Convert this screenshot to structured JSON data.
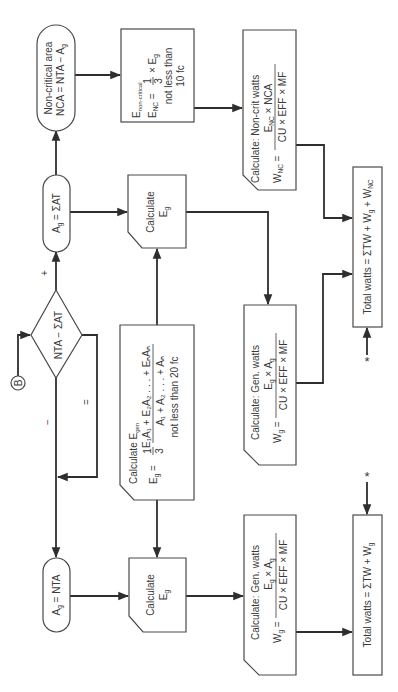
{
  "diagram": {
    "orientation": "rotated-90-ccw",
    "connector": {
      "label": "B"
    },
    "decision": {
      "label": "NTA − ΣAT",
      "branches": {
        "plus": "+",
        "minus": "−",
        "equal": "="
      }
    },
    "terminals": {
      "noncritical": {
        "line1": "Non-critical area",
        "line2_main": "NCA = NTA − A",
        "line2_sub": "g"
      },
      "ag_sum": {
        "main": "A",
        "sub": "g",
        "rest": " = ΣAT"
      },
      "ag_nta": {
        "main": "A",
        "sub": "g",
        "rest": " = NTA"
      }
    },
    "enc_box": {
      "title_main": "E",
      "title_sub": "non-critical",
      "lhs_main": "E",
      "lhs_sub": "NC",
      "eq": " =",
      "num": "1",
      "den": "3",
      "rhs": "× E",
      "rhs_sub": "g",
      "line3": "not less than",
      "line4": "10 fc"
    },
    "calc_eg": {
      "line1": "Calculate",
      "line2_main": "E",
      "line2_sub": "g"
    },
    "egen_box": {
      "title": "Calculate E",
      "title_sub": "gen",
      "lhs_main": "E",
      "lhs_sub": "g",
      "eq": " =",
      "coef_num": "1",
      "coef_den": "3",
      "num": "E₁A₁ + E₂A₂ . . . + EₙAₙ",
      "den": "A₁ + A₂ . . . + Aₙ",
      "note": "not less than 20 fc"
    },
    "wnc_box": {
      "title": "Calculate:  Non-crit watts",
      "lhs_main": "W",
      "lhs_sub": "NC",
      "eq": " =",
      "num": "E",
      "num_sub": "NC",
      "num_rest": " × NCA",
      "den": "CU × EFF × MF"
    },
    "wg_box": {
      "title": "Calculate:  Gen. watts",
      "lhs_main": "W",
      "lhs_sub": "g",
      "eq": " =",
      "num": "E",
      "num_sub": "g",
      "num_mid": " × A",
      "num_sub2": "g",
      "den": "CU × EFF × MF"
    },
    "total_full": {
      "text1": "Total watts = ΣTW + W",
      "sub1": "g",
      "text2": " + W",
      "sub2": "NC"
    },
    "total_simple": {
      "text1": "Total watts = ΣTW + W",
      "sub1": "g"
    },
    "asterisk": "*"
  }
}
